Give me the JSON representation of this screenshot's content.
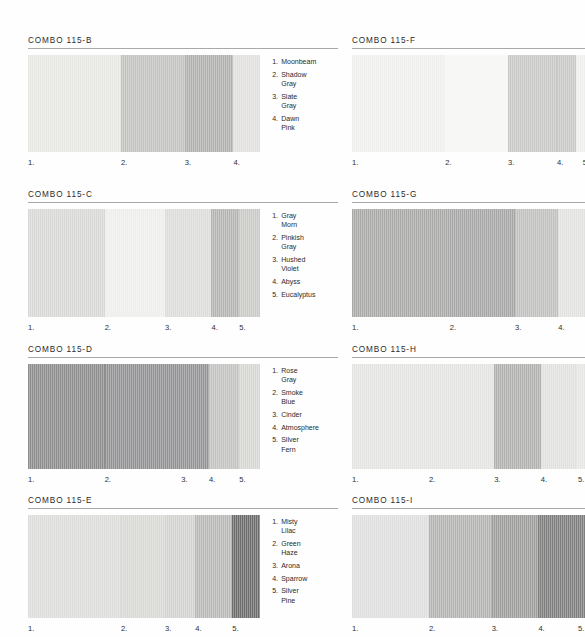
{
  "sheet": {
    "title_prefix": "COMBO",
    "series": "115"
  },
  "combos": [
    {
      "id": "combo-115-b",
      "title": "COMBO 115-B",
      "column": "left",
      "top": 36,
      "swatch_height": 97,
      "swatch_width": 240,
      "swatches": [
        {
          "num": "1.",
          "name": "Moonbeam",
          "color": "#e7e7e4",
          "width": 40.0,
          "tick_x": 0.0
        },
        {
          "num": "2.",
          "name": "Shadow Gray",
          "color": "#c2c2c0",
          "width": 27.5,
          "tick_x": 40.0
        },
        {
          "num": "3.",
          "name": "Slate Gray",
          "color": "#b0b0ae",
          "width": 21.0,
          "tick_x": 67.5
        },
        {
          "num": "4.",
          "name": "Dawn Pink",
          "color": "#e2e0dd",
          "width": 11.5,
          "tick_x": 88.5
        }
      ],
      "names": [
        {
          "num": "1.",
          "lines": [
            "Moonbeam"
          ]
        },
        {
          "num": "2.",
          "lines": [
            "Shadow",
            "Gray"
          ]
        },
        {
          "num": "3.",
          "lines": [
            "Slate",
            "Gray"
          ]
        },
        {
          "num": "4.",
          "lines": [
            "Dawn",
            "Pink"
          ]
        }
      ]
    },
    {
      "id": "combo-115-c",
      "title": "COMBO 115-C",
      "column": "left",
      "top": 190,
      "swatch_height": 108,
      "swatch_width": 240,
      "swatches": [
        {
          "num": "1.",
          "name": "Gray Morn",
          "color": "#d8d8d6",
          "width": 33.0,
          "tick_x": 0.0
        },
        {
          "num": "2.",
          "name": "Pinkish Gray",
          "color": "#eeeeec",
          "width": 26.0,
          "tick_x": 33.0
        },
        {
          "num": "3.",
          "name": "Hushed Violet",
          "color": "#dcdcda",
          "width": 20.0,
          "tick_x": 59.0
        },
        {
          "num": "4.",
          "name": "Abyss",
          "color": "#b4b4b2",
          "width": 12.0,
          "tick_x": 79.0
        },
        {
          "num": "5.",
          "name": "Eucalyptus",
          "color": "#c9c9c5",
          "width": 9.0,
          "tick_x": 91.0
        }
      ],
      "names": [
        {
          "num": "1.",
          "lines": [
            "Gray",
            "Morn"
          ]
        },
        {
          "num": "2.",
          "lines": [
            "Pinkish",
            "Gray"
          ]
        },
        {
          "num": "3.",
          "lines": [
            "Hushed",
            "Violet"
          ]
        },
        {
          "num": "4.",
          "lines": [
            "Abyss"
          ]
        },
        {
          "num": "5.",
          "lines": [
            "Eucalyptus"
          ]
        }
      ]
    },
    {
      "id": "combo-115-d",
      "title": "COMBO 115-D",
      "column": "left",
      "top": 345,
      "swatch_height": 105,
      "swatch_width": 240,
      "swatches": [
        {
          "num": "1.",
          "name": "Rose Gray",
          "color": "#8d8d8d",
          "width": 33.0,
          "tick_x": 0.0
        },
        {
          "num": "2.",
          "name": "Smoke Blue",
          "color": "#919193",
          "width": 33.0,
          "tick_x": 33.0
        },
        {
          "num": "3.",
          "name": "Cinder",
          "color": "#939395",
          "width": 12.0,
          "tick_x": 66.0
        },
        {
          "num": "4.",
          "name": "Atmosphere",
          "color": "#c2c2c0",
          "width": 13.0,
          "tick_x": 78.0
        },
        {
          "num": "5.",
          "name": "Silver Fern",
          "color": "#d6d6d2",
          "width": 9.0,
          "tick_x": 91.0
        }
      ],
      "names": [
        {
          "num": "1.",
          "lines": [
            "Rose",
            "Gray"
          ]
        },
        {
          "num": "2.",
          "lines": [
            "Smoke",
            "Blue"
          ]
        },
        {
          "num": "3.",
          "lines": [
            "Cinder"
          ]
        },
        {
          "num": "4.",
          "lines": [
            "Atmosphere"
          ]
        },
        {
          "num": "5.",
          "lines": [
            "Silver",
            "Fern"
          ]
        }
      ]
    },
    {
      "id": "combo-115-e",
      "title": "COMBO 115-E",
      "column": "left",
      "top": 496,
      "swatch_height": 103,
      "swatch_width": 240,
      "swatches": [
        {
          "num": "1.",
          "name": "Misty Lilac",
          "color": "#dcdcda",
          "width": 40.0,
          "tick_x": 0.0
        },
        {
          "num": "2.",
          "name": "Green Haze",
          "color": "#d8d8d4",
          "width": 19.0,
          "tick_x": 40.0
        },
        {
          "num": "3.",
          "name": "Arona",
          "color": "#d2d2d0",
          "width": 13.0,
          "tick_x": 59.0
        },
        {
          "num": "4.",
          "name": "Sparrow",
          "color": "#b8b8b6",
          "width": 16.0,
          "tick_x": 72.0
        },
        {
          "num": "5.",
          "name": "Silver Pine",
          "color": "#6d6d6d",
          "width": 12.0,
          "tick_x": 88.0
        }
      ],
      "names": [
        {
          "num": "1.",
          "lines": [
            "Misty",
            "Lilac"
          ]
        },
        {
          "num": "2.",
          "lines": [
            "Green",
            "Haze"
          ]
        },
        {
          "num": "3.",
          "lines": [
            "Arona"
          ]
        },
        {
          "num": "4.",
          "lines": [
            "Sparrow"
          ]
        },
        {
          "num": "5.",
          "lines": [
            "Silver",
            "Pine"
          ]
        }
      ]
    },
    {
      "id": "combo-115-f",
      "title": "COMBO 115-F",
      "column": "right",
      "top": 36,
      "swatch_height": 97,
      "swatch_width": 233,
      "swatches": [
        {
          "num": "1.",
          "name": "",
          "color": "#eff0ee",
          "width": 40.0,
          "tick_x": 0.0
        },
        {
          "num": "2.",
          "name": "",
          "color": "#f6f6f4",
          "width": 27.0,
          "tick_x": 40.0
        },
        {
          "num": "3.",
          "name": "",
          "color": "#c8c8c6",
          "width": 21.0,
          "tick_x": 67.0
        },
        {
          "num": "4.",
          "name": "",
          "color": "#c8c8c6",
          "width": 8.0,
          "tick_x": 88.0
        },
        {
          "num": "5.",
          "name": "",
          "color": "#efefed",
          "width": 4.0,
          "tick_x": 99.0
        }
      ],
      "names": []
    },
    {
      "id": "combo-115-g",
      "title": "COMBO 115-G",
      "column": "right",
      "top": 190,
      "swatch_height": 108,
      "swatch_width": 233,
      "swatches": [
        {
          "num": "1.",
          "name": "",
          "color": "#a9a9a7",
          "width": 42.0,
          "tick_x": 0.0
        },
        {
          "num": "2.",
          "name": "",
          "color": "#a6a6a6",
          "width": 28.0,
          "tick_x": 42.0
        },
        {
          "num": "3.",
          "name": "",
          "color": "#c0c0be",
          "width": 18.5,
          "tick_x": 70.0
        },
        {
          "num": "4.",
          "name": "",
          "color": "#e2e2e0",
          "width": 11.5,
          "tick_x": 88.5
        }
      ],
      "names": []
    },
    {
      "id": "combo-115-h",
      "title": "COMBO 115-H",
      "column": "right",
      "top": 345,
      "swatch_height": 105,
      "swatch_width": 233,
      "swatches": [
        {
          "num": "1.",
          "name": "",
          "color": "#e4e4e2",
          "width": 61.0,
          "tick_x": 0.0
        },
        {
          "num": "2.",
          "name": "",
          "color": "#e4e4e2",
          "width": 0.0,
          "tick_x": 33.0
        },
        {
          "num": "3.",
          "name": "",
          "color": "#b1b1af",
          "width": 20.0,
          "tick_x": 61.0
        },
        {
          "num": "4.",
          "name": "",
          "color": "#e1e1df",
          "width": 15.0,
          "tick_x": 81.0
        },
        {
          "num": "5.",
          "name": "",
          "color": "#e6e6e4",
          "width": 4.0,
          "tick_x": 97.0
        }
      ],
      "names": []
    },
    {
      "id": "combo-115-i",
      "title": "COMBO 115-I",
      "column": "right",
      "top": 496,
      "swatch_height": 103,
      "swatch_width": 233,
      "swatches": [
        {
          "num": "1.",
          "name": "",
          "color": "#dedede",
          "width": 33.0,
          "tick_x": 0.0
        },
        {
          "num": "2.",
          "name": "",
          "color": "#b3b3b1",
          "width": 27.0,
          "tick_x": 33.0
        },
        {
          "num": "3.",
          "name": "",
          "color": "#9d9d9b",
          "width": 20.0,
          "tick_x": 60.0
        },
        {
          "num": "4.",
          "name": "",
          "color": "#7e7e7e",
          "width": 16.0,
          "tick_x": 80.0
        },
        {
          "num": "5.",
          "name": "",
          "color": "#7e7e7e",
          "width": 4.0,
          "tick_x": 97.0
        }
      ],
      "names": []
    }
  ]
}
